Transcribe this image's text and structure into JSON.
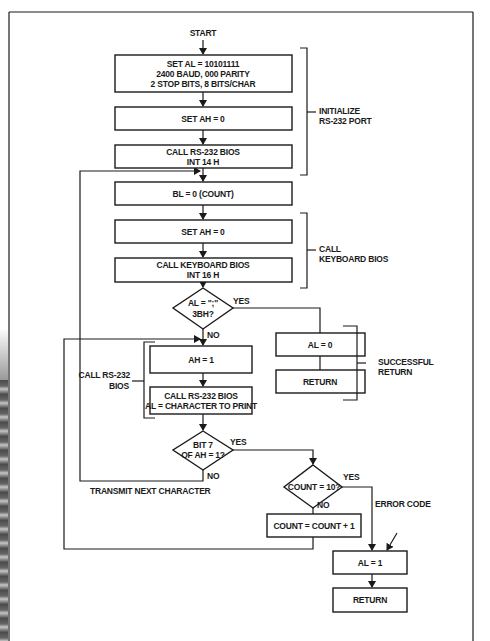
{
  "flowchart": {
    "start": "START",
    "boxes": {
      "set_al": [
        "SET AL = 10101111",
        "2400 BAUD, 000 PARITY",
        "2 STOP BITS, 8 BITS/CHAR"
      ],
      "set_ah_0_first": "SET AH = 0",
      "call_rs232_init": [
        "CALL RS-232 BIOS",
        "INT 14 H"
      ],
      "bl_zero": "BL = 0 (COUNT)",
      "set_ah_0_second": "SET AH = 0",
      "call_keyboard": [
        "CALL KEYBOARD BIOS",
        "INT 16 H"
      ],
      "ah_1": "AH = 1",
      "call_rs232_print": [
        "CALL RS-232 BIOS",
        "AL = CHARACTER TO PRINT"
      ],
      "al_0": "AL = 0",
      "return_success": "RETURN",
      "count_inc": "COUNT = COUNT + 1",
      "al_1": "AL = 1",
      "return_error": "RETURN"
    },
    "decisions": {
      "semicolon": [
        "AL = \";\"",
        "3BH?"
      ],
      "bit7": [
        "BIT 7",
        "OF AH = 1?"
      ],
      "count10": "COUNT = 10?"
    },
    "branch_labels": {
      "semicolon_yes": "YES",
      "semicolon_no": "NO",
      "bit7_yes": "YES",
      "bit7_no": "NO",
      "count_yes": "YES",
      "count_no": "NO"
    },
    "annotations": {
      "initialize": [
        "INITIALIZE",
        "RS-232 PORT"
      ],
      "call_keyboard": [
        "CALL",
        "KEYBOARD BIOS"
      ],
      "successful_return": [
        "SUCCESSFUL",
        "RETURN"
      ],
      "call_rs232": [
        "CALL RS-232",
        "BIOS"
      ],
      "transmit_next": "TRANSMIT NEXT CHARACTER",
      "error_code": "ERROR CODE"
    }
  }
}
